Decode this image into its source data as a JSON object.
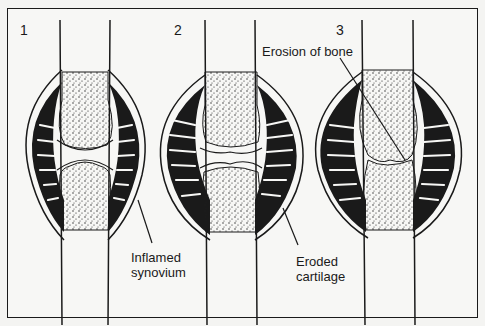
{
  "figure": {
    "panels": [
      {
        "number": "1",
        "stage": "normal joint with inflamed synovium"
      },
      {
        "number": "2",
        "stage": "cartilage eroded"
      },
      {
        "number": "3",
        "stage": "bone erosion, joint fused"
      }
    ],
    "labels": {
      "inflamed_synovium_line1": "Inflamed",
      "inflamed_synovium_line2": "synovium",
      "eroded_cartilage_line1": "Eroded",
      "eroded_cartilage_line2": "cartilage",
      "erosion_of_bone": "Erosion of bone"
    },
    "colors": {
      "ink": "#1a1a1a",
      "paper": "#f7f7f5"
    }
  }
}
